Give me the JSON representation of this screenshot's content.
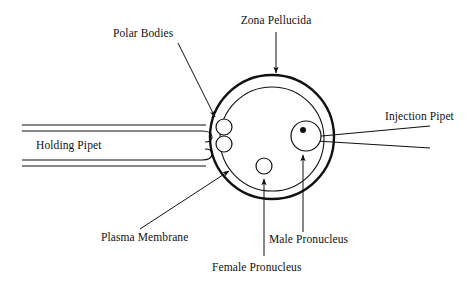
{
  "diagram": {
    "background_color": "#ffffff",
    "stroke_color": "#111111",
    "canvas": {
      "width": 471,
      "height": 283
    }
  },
  "labels": {
    "zona_pellucida": "Zona Pellucida",
    "polar_bodies": "Polar Bodies",
    "injection_pipet": "Injection Pipet",
    "holding_pipet": "Holding Pipet",
    "plasma_membrane": "Plasma Membrane",
    "male_pronucleus": "Male Pronucleus",
    "female_pronucleus": "Female Pronucleus"
  },
  "structures": {
    "zona_pellucida": {
      "cx": 272,
      "cy": 137,
      "r": 62,
      "stroke_width": 2.4
    },
    "plasma_membrane": {
      "cx": 272,
      "cy": 139,
      "r": 52,
      "stroke_width": 1.1
    },
    "polar_body_upper": {
      "cx": 224,
      "cy": 127,
      "r": 8
    },
    "polar_body_lower": {
      "cx": 224,
      "cy": 144,
      "r": 8
    },
    "male_pronucleus": {
      "cx": 306,
      "cy": 136,
      "r": 15
    },
    "male_pronucleus_nucleolus": {
      "cx": 303,
      "cy": 130,
      "r": 3
    },
    "female_pronucleus": {
      "cx": 264,
      "cy": 166,
      "r": 8
    },
    "holding_pipet": {
      "x_start": 22,
      "outer_top_y": 125,
      "outer_bottom_y": 166,
      "inner_top_y": 131,
      "inner_bottom_y": 160,
      "tip_x": 210
    },
    "injection_pipet": {
      "tip_x": 300,
      "tip_y": 139,
      "back_x": 430,
      "back_top_y": 126,
      "back_bottom_y": 148
    }
  },
  "leaders": [
    {
      "name": "zona-pellucida-leader",
      "x1": 276,
      "y1": 32,
      "x2": 276,
      "y2": 75,
      "arrow": true
    },
    {
      "name": "polar-bodies-leader",
      "x1": 178,
      "y1": 43,
      "x2": 216,
      "y2": 118,
      "arrow": true
    },
    {
      "name": "injection-pipet-leader",
      "x1": 0,
      "y1": 0,
      "x2": 0,
      "y2": 0,
      "arrow": false
    },
    {
      "name": "plasma-membrane-leader",
      "x1": 140,
      "y1": 230,
      "x2": 228,
      "y2": 172,
      "arrow": true
    },
    {
      "name": "male-pronucleus-leader",
      "x1": 303,
      "y1": 232,
      "x2": 303,
      "y2": 156,
      "arrow": true
    },
    {
      "name": "female-pronucleus-leader",
      "x1": 264,
      "y1": 256,
      "x2": 264,
      "y2": 180,
      "arrow": true
    }
  ],
  "label_positions": {
    "zona_pellucida": {
      "x": 276,
      "y": 15
    },
    "polar_bodies": {
      "x": 155,
      "y": 28
    },
    "injection_pipet": {
      "x": 385,
      "y": 111
    },
    "holding_pipet": {
      "x": 36,
      "y": 140
    },
    "plasma_membrane": {
      "x": 101,
      "y": 232
    },
    "male_pronucleus": {
      "x": 269,
      "y": 234
    },
    "female_pronucleus": {
      "x": 212,
      "y": 262
    }
  }
}
